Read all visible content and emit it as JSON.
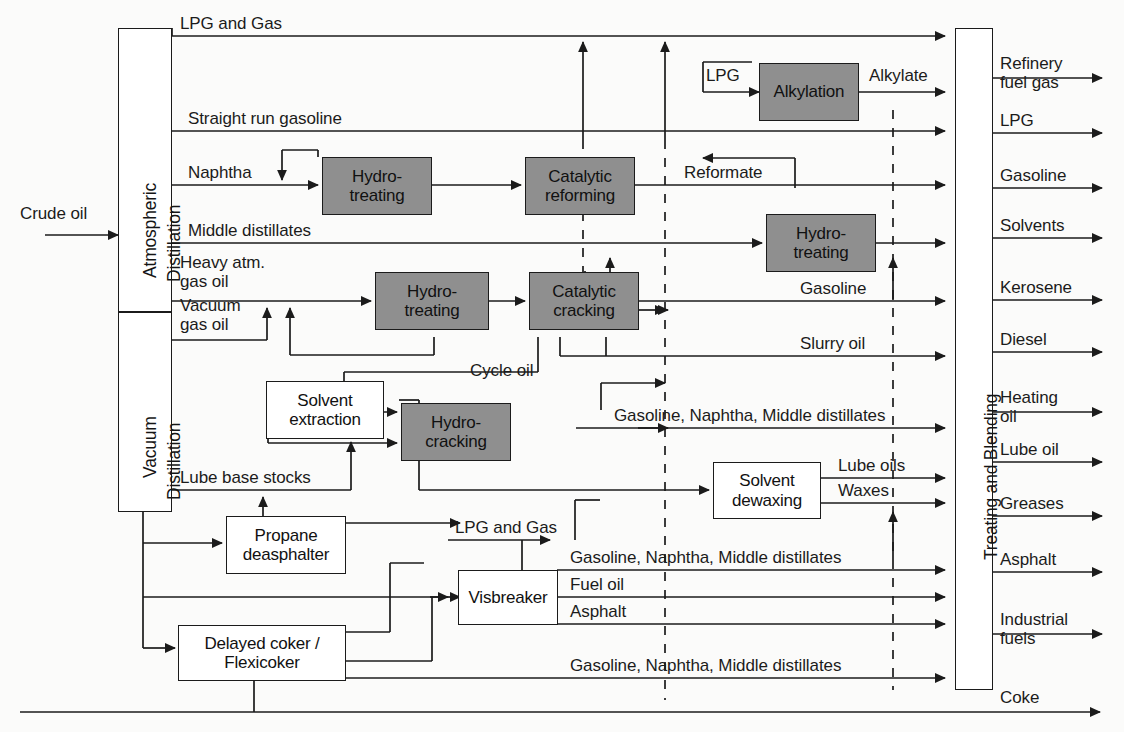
{
  "diagram": {
    "type": "process-flow",
    "colors": {
      "line": "#1b1b1b",
      "shaded_unit_fill": "#8f8f8f",
      "plain_unit_fill": "#ffffff",
      "background": "#fbfbfa"
    }
  },
  "inputs": [
    {
      "label": "Crude oil"
    }
  ],
  "columns": [
    {
      "id": "atmospheric",
      "label": "Atmospheric\nDistillation",
      "line1": "Atmospheric",
      "line2": "Distillation"
    },
    {
      "id": "vacuum",
      "label": "Vacuum\nDistillation",
      "line1": "Vacuum",
      "line2": "Distillation"
    },
    {
      "id": "blending",
      "label": "Treating and Blending"
    }
  ],
  "units": [
    {
      "id": "alkylation",
      "label": "Alkylation",
      "style": "shaded"
    },
    {
      "id": "hydrotreat_nap",
      "label": "Hydro-\ntreating",
      "style": "shaded"
    },
    {
      "id": "cat_reforming",
      "label": "Catalytic\nreforming",
      "style": "shaded"
    },
    {
      "id": "hydrotreat_md",
      "label": "Hydro-\ntreating",
      "style": "shaded"
    },
    {
      "id": "hydrotreat_gas",
      "label": "Hydro-\ntreating",
      "style": "shaded"
    },
    {
      "id": "cat_cracking",
      "label": "Catalytic\ncracking",
      "style": "shaded"
    },
    {
      "id": "hydrocracking",
      "label": "Hydro-\ncracking",
      "style": "shaded"
    },
    {
      "id": "solvent_extr",
      "label": "Solvent\nextraction",
      "style": "plain"
    },
    {
      "id": "solvent_dewax",
      "label": "Solvent\ndewaxing",
      "style": "plain"
    },
    {
      "id": "propane_deasph",
      "label": "Propane\ndeasphalter",
      "style": "plain"
    },
    {
      "id": "visbreaker",
      "label": "Visbreaker",
      "style": "plain"
    },
    {
      "id": "coker",
      "label": "Delayed coker /\nFlexicoker",
      "style": "plain"
    }
  ],
  "unit_lines": {
    "alkylation": [
      "Alkylation"
    ],
    "hydrotreat_nap": [
      "Hydro-",
      "treating"
    ],
    "cat_reforming": [
      "Catalytic",
      "reforming"
    ],
    "hydrotreat_md": [
      "Hydro-",
      "treating"
    ],
    "hydrotreat_gas": [
      "Hydro-",
      "treating"
    ],
    "cat_cracking": [
      "Catalytic",
      "cracking"
    ],
    "hydrocracking": [
      "Hydro-",
      "cracking"
    ],
    "solvent_extr": [
      "Solvent",
      "extraction"
    ],
    "solvent_dewax": [
      "Solvent",
      "dewaxing"
    ],
    "propane_deasph": [
      "Propane",
      "deasphalter"
    ],
    "visbreaker": [
      "Visbreaker"
    ],
    "coker": [
      "Delayed coker /",
      "Flexicoker"
    ]
  },
  "stream_labels": [
    {
      "id": "lpg_and_gas_top",
      "text": "LPG and Gas"
    },
    {
      "id": "straight_run_gas",
      "text": "Straight run gasoline"
    },
    {
      "id": "naphtha",
      "text": "Naphtha"
    },
    {
      "id": "middle_distillates",
      "text": "Middle distillates"
    },
    {
      "id": "heavy_atm_gas_oil",
      "text": "Heavy atm.\ngas oil"
    },
    {
      "id": "vacuum_gas_oil",
      "text": "Vacuum\ngas oil"
    },
    {
      "id": "lube_base_stocks",
      "text": "Lube base stocks"
    },
    {
      "id": "lpg_alky",
      "text": "LPG"
    },
    {
      "id": "alkylate",
      "text": "Alkylate"
    },
    {
      "id": "reformate",
      "text": "Reformate"
    },
    {
      "id": "gasoline_cc",
      "text": "Gasoline"
    },
    {
      "id": "slurry_oil",
      "text": "Slurry oil"
    },
    {
      "id": "cycle_oil",
      "text": "Cycle oil"
    },
    {
      "id": "gnm_hydrocracker",
      "text": "Gasoline, Naphtha, Middle distillates"
    },
    {
      "id": "lube_oils",
      "text": "Lube oils"
    },
    {
      "id": "waxes",
      "text": "Waxes"
    },
    {
      "id": "lpg_and_gas_vb",
      "text": "LPG and Gas"
    },
    {
      "id": "gnm_visbreaker",
      "text": "Gasoline, Naphtha, Middle distillates"
    },
    {
      "id": "fuel_oil",
      "text": "Fuel oil"
    },
    {
      "id": "asphalt_vb",
      "text": "Asphalt"
    },
    {
      "id": "gnm_coker",
      "text": "Gasoline, Naphtha, Middle distillates"
    }
  ],
  "heavy_atm_gas_oil_lines": [
    "Heavy atm.",
    "gas oil"
  ],
  "vacuum_gas_oil_lines": [
    "Vacuum",
    "gas oil"
  ],
  "products": [
    {
      "id": "refinery_fuel_gas",
      "text": "Refinery\nfuel gas",
      "lines": [
        "Refinery",
        "fuel gas"
      ]
    },
    {
      "id": "lpg",
      "text": "LPG",
      "lines": [
        "LPG"
      ]
    },
    {
      "id": "gasoline",
      "text": "Gasoline",
      "lines": [
        "Gasoline"
      ]
    },
    {
      "id": "solvents",
      "text": "Solvents",
      "lines": [
        "Solvents"
      ]
    },
    {
      "id": "kerosene",
      "text": "Kerosene",
      "lines": [
        "Kerosene"
      ]
    },
    {
      "id": "diesel",
      "text": "Diesel",
      "lines": [
        "Diesel"
      ]
    },
    {
      "id": "heating_oil",
      "text": "Heating\noil",
      "lines": [
        "Heating",
        "oil"
      ]
    },
    {
      "id": "lube_oil",
      "text": "Lube oil",
      "lines": [
        "Lube oil"
      ]
    },
    {
      "id": "greases",
      "text": "Greases",
      "lines": [
        "Greases"
      ]
    },
    {
      "id": "asphalt",
      "text": "Asphalt",
      "lines": [
        "Asphalt"
      ]
    },
    {
      "id": "industrial_fuels",
      "text": "Industrial\nfuels",
      "lines": [
        "Industrial",
        "fuels"
      ]
    },
    {
      "id": "coke",
      "text": "Coke",
      "lines": [
        "Coke"
      ]
    }
  ]
}
